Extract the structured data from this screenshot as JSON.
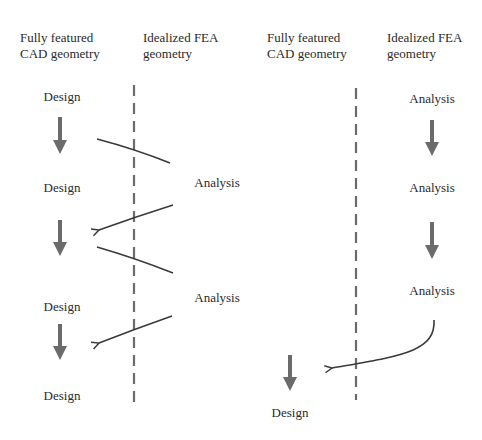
{
  "colors": {
    "background": "#ffffff",
    "text": "#2a2a2a",
    "thick_arrow": "#6b6b6b",
    "thin_line": "#3a3a3a",
    "dashed_divider": "#6b6b6b"
  },
  "left_panel": {
    "header_cad": [
      "Fully featured",
      "CAD geometry"
    ],
    "header_fea": [
      "Idealized FEA",
      "geometry"
    ],
    "cad_nodes": [
      "Design",
      "Design",
      "Design",
      "Design"
    ],
    "fea_nodes": [
      "Analysis",
      "Analysis"
    ]
  },
  "right_panel": {
    "header_cad": [
      "Fully featured",
      "CAD geometry"
    ],
    "header_fea": [
      "Idealized FEA",
      "geometry"
    ],
    "fea_nodes": [
      "Analysis",
      "Analysis",
      "Analysis"
    ],
    "cad_nodes": [
      "Design"
    ]
  }
}
